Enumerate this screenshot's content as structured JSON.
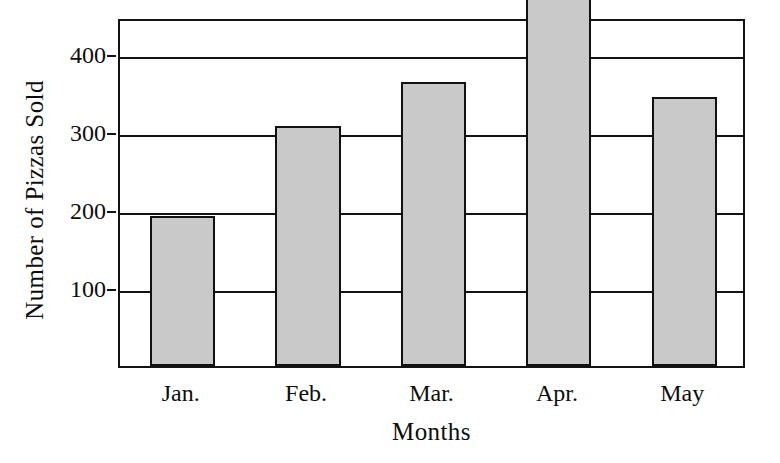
{
  "chart_data": {
    "type": "bar",
    "title": "",
    "xlabel": "Months",
    "ylabel": "Number of Pizzas Sold",
    "categories": [
      "Jan.",
      "Feb.",
      "Mar.",
      "Apr.",
      "May"
    ],
    "values": [
      192,
      308,
      365,
      475,
      345
    ],
    "series": [
      {
        "name": "Number of Pizzas Sold",
        "values": [
          192,
          308,
          365,
          475,
          345
        ]
      }
    ],
    "ylim": [
      0,
      448
    ],
    "ytick_labels": [
      "100",
      "200",
      "300",
      "400"
    ],
    "ytick_values": [
      100,
      200,
      300,
      400
    ],
    "grid": "horizontal",
    "legend": "none",
    "bar_fill_color": "#c9c9c9",
    "bar_border_color": "#111111",
    "axis_color": "#131313",
    "background_color": "#ffffff"
  },
  "axes": {
    "y_title": "Number of Pizzas Sold",
    "x_title": "Months"
  },
  "y_ticks": [
    {
      "label": "400",
      "value": 400
    },
    {
      "label": "300",
      "value": 300
    },
    {
      "label": "200",
      "value": 200
    },
    {
      "label": "100",
      "value": 100
    }
  ],
  "bars": [
    {
      "label": "Jan.",
      "value": 192
    },
    {
      "label": "Feb.",
      "value": 308
    },
    {
      "label": "Mar.",
      "value": 365
    },
    {
      "label": "Apr.",
      "value": 475
    },
    {
      "label": "May",
      "value": 345
    }
  ]
}
